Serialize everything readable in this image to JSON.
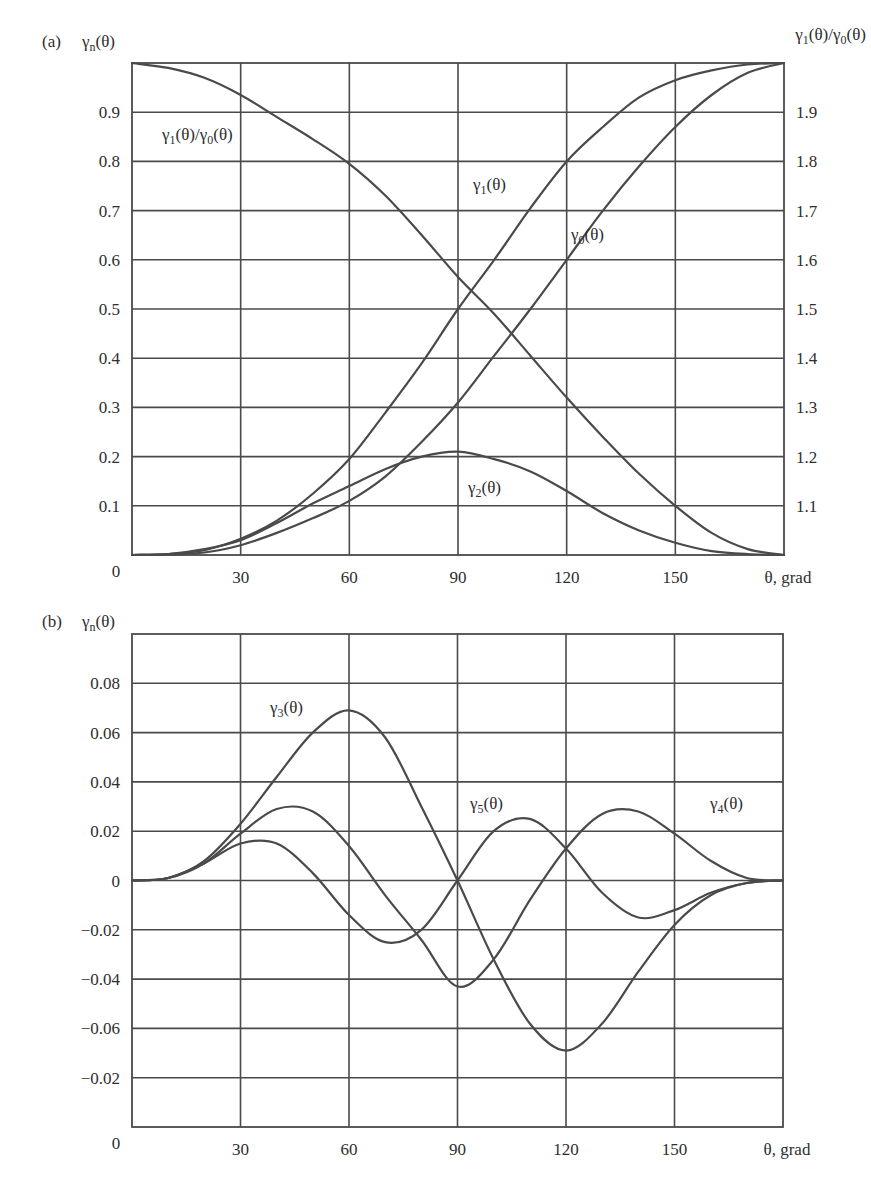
{
  "chart_data": [
    {
      "id": "a",
      "type": "line",
      "panel_label": "(a)",
      "title": "",
      "ylabel": {
        "base": "γ",
        "sub": "n",
        "rest": "(θ)"
      },
      "ylabel_right": {
        "parts": [
          {
            "base": "γ",
            "sub": "1",
            "rest": "(θ)/"
          },
          {
            "base": "γ",
            "sub": "0",
            "rest": "(θ)"
          }
        ]
      },
      "xlabel": "θ, grad",
      "xlim": [
        0,
        180
      ],
      "ylim": [
        0,
        1.0
      ],
      "ylim_right": [
        1.0,
        2.0
      ],
      "x_ticks": [
        30,
        60,
        90,
        120,
        150
      ],
      "x_tick_labels": [
        "30",
        "60",
        "90",
        "120",
        "150"
      ],
      "origin_label": "0",
      "y_ticks": [
        0.1,
        0.2,
        0.3,
        0.4,
        0.5,
        0.6,
        0.7,
        0.8,
        0.9
      ],
      "y_tick_labels": [
        "0.1",
        "0.2",
        "0.3",
        "0.4",
        "0.5",
        "0.6",
        "0.7",
        "0.8",
        "0.9"
      ],
      "y_right_tick_labels": [
        "1.1",
        "1.2",
        "1.3",
        "1.4",
        "1.5",
        "1.6",
        "1.7",
        "1.8",
        "1.9"
      ],
      "grid": true,
      "x": [
        0,
        10,
        20,
        30,
        40,
        50,
        60,
        70,
        80,
        90,
        100,
        110,
        120,
        130,
        140,
        150,
        160,
        170,
        180
      ],
      "series": [
        {
          "name": "γ1(θ)/γ0(θ)",
          "label": {
            "base": "γ",
            "sub": "1",
            "rest": "(θ)/",
            "base2": "γ",
            "sub2": "0",
            "rest2": "(θ)"
          },
          "values": [
            1.0,
            0.99,
            0.97,
            0.935,
            0.89,
            0.845,
            0.795,
            0.73,
            0.65,
            0.565,
            0.49,
            0.405,
            0.32,
            0.24,
            0.165,
            0.1,
            0.045,
            0.012,
            0.0
          ]
        },
        {
          "name": "γ1(θ)",
          "label": {
            "base": "γ",
            "sub": "1",
            "rest": "(θ)"
          },
          "values": [
            0.0,
            0.002,
            0.01,
            0.033,
            0.07,
            0.125,
            0.195,
            0.29,
            0.39,
            0.5,
            0.6,
            0.705,
            0.8,
            0.87,
            0.93,
            0.965,
            0.985,
            0.997,
            1.0
          ]
        },
        {
          "name": "γ0(θ)",
          "label": {
            "base": "γ",
            "sub": "0",
            "rest": "(θ)"
          },
          "values": [
            0.0,
            0.001,
            0.005,
            0.02,
            0.045,
            0.075,
            0.11,
            0.16,
            0.23,
            0.31,
            0.405,
            0.5,
            0.6,
            0.7,
            0.79,
            0.87,
            0.935,
            0.98,
            1.0
          ]
        },
        {
          "name": "γ2(θ)",
          "label": {
            "base": "γ",
            "sub": "2",
            "rest": "(θ)"
          },
          "values": [
            0.0,
            0.002,
            0.012,
            0.03,
            0.065,
            0.105,
            0.14,
            0.175,
            0.2,
            0.21,
            0.195,
            0.17,
            0.13,
            0.085,
            0.05,
            0.025,
            0.008,
            0.002,
            0.0
          ]
        }
      ]
    },
    {
      "id": "b",
      "type": "line",
      "panel_label": "(b)",
      "title": "",
      "ylabel": {
        "base": "γ",
        "sub": "n",
        "rest": "(θ)"
      },
      "xlabel": "θ, grad",
      "xlim": [
        0,
        180
      ],
      "ylim": [
        -0.1,
        0.1
      ],
      "x_ticks": [
        30,
        60,
        90,
        120,
        150
      ],
      "x_tick_labels": [
        "30",
        "60",
        "90",
        "120",
        "150"
      ],
      "origin_label": "0",
      "y_ticks": [
        0.08,
        0.06,
        0.04,
        0.02,
        0,
        -0.02,
        -0.04,
        -0.06,
        -0.08
      ],
      "y_tick_labels": [
        "0.08",
        "0.06",
        "0.04",
        "0.02",
        "0",
        "-0.02",
        "-0.04",
        "-0.06",
        "-0.02"
      ],
      "grid": true,
      "x": [
        0,
        10,
        20,
        30,
        40,
        50,
        60,
        70,
        80,
        90,
        100,
        110,
        120,
        130,
        140,
        150,
        160,
        170,
        180
      ],
      "series": [
        {
          "name": "γ3(θ)",
          "label": {
            "base": "γ",
            "sub": "3",
            "rest": "(θ)"
          },
          "values": [
            0.0,
            0.001,
            0.008,
            0.023,
            0.042,
            0.06,
            0.069,
            0.058,
            0.03,
            0.0,
            -0.032,
            -0.058,
            -0.069,
            -0.058,
            -0.037,
            -0.018,
            -0.006,
            -0.001,
            0.0
          ]
        },
        {
          "name": "γ4(θ)",
          "label": {
            "base": "γ",
            "sub": "4",
            "rest": "(θ)"
          },
          "values": [
            0.0,
            0.001,
            0.007,
            0.019,
            0.029,
            0.028,
            0.014,
            -0.006,
            -0.024,
            -0.043,
            -0.032,
            -0.008,
            0.013,
            0.027,
            0.028,
            0.019,
            0.008,
            0.001,
            0.0
          ]
        },
        {
          "name": "γ5(θ)",
          "label": {
            "base": "γ",
            "sub": "5",
            "rest": "(θ)"
          },
          "values": [
            0.0,
            0.001,
            0.007,
            0.015,
            0.015,
            0.003,
            -0.014,
            -0.025,
            -0.02,
            0.0,
            0.02,
            0.025,
            0.013,
            -0.005,
            -0.015,
            -0.012,
            -0.005,
            -0.001,
            0.0
          ]
        }
      ]
    }
  ],
  "caption_fragment": ""
}
